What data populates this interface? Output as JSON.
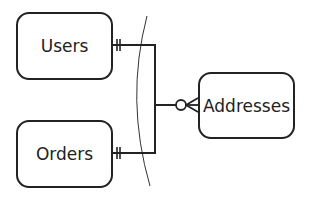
{
  "diagram": {
    "type": "entity-relationship",
    "entities": [
      {
        "id": "users",
        "label": "Users"
      },
      {
        "id": "orders",
        "label": "Orders"
      },
      {
        "id": "addresses",
        "label": "Addresses"
      }
    ],
    "relationships": [
      {
        "from": "users",
        "to": "addresses",
        "from_cardinality": "exactly-one",
        "to_cardinality": "zero-or-many"
      },
      {
        "from": "orders",
        "to": "addresses",
        "from_cardinality": "exactly-one",
        "to_cardinality": "zero-or-many"
      }
    ],
    "colors": {
      "stroke": "#222222",
      "background": "#ffffff"
    }
  }
}
